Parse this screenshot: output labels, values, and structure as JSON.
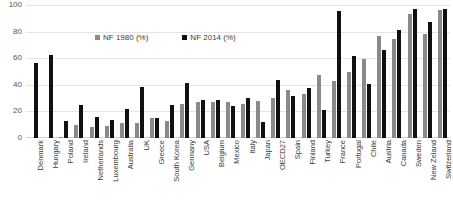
{
  "chart_data": {
    "type": "bar",
    "title": "",
    "xlabel": "",
    "ylabel": "",
    "ylim": [
      0,
      100
    ],
    "yticks": [
      0,
      20,
      40,
      60,
      80,
      100
    ],
    "grid": true,
    "legend_position": "top-center",
    "categories": [
      "Denmark",
      "Hungary",
      "Poland",
      "Ireland",
      "Netherlands",
      "Luxembourg",
      "Australia",
      "UK",
      "Greece",
      "South Korea",
      "Germany",
      "USA",
      "Belgium",
      "Mexico",
      "Italy",
      "Japan",
      "OECD27",
      "Spain",
      "Finland",
      "Turkey",
      "France",
      "Portugal",
      "Chile",
      "Austria",
      "Canada",
      "Sweden",
      "New Zeland",
      "Switzerland"
    ],
    "series": [
      {
        "name": "NF 1980 (%)",
        "color": "#8a8a8a",
        "values": [
          0,
          0,
          1,
          10,
          8,
          9,
          11,
          11,
          15,
          13,
          26,
          27,
          27,
          27,
          26,
          28,
          30,
          36,
          33,
          48,
          43,
          50,
          60,
          77,
          75,
          94,
          79,
          97
        ]
      },
      {
        "name": "NF 2014 (%)",
        "color": "#101010",
        "values": [
          57,
          63,
          13,
          25,
          16,
          14,
          22,
          39,
          15,
          25,
          42,
          29,
          29,
          24,
          30,
          12,
          44,
          32,
          38,
          21,
          96,
          62,
          41,
          67,
          82,
          98,
          88,
          98
        ]
      }
    ]
  },
  "axis": {
    "y_ticks": [
      "0",
      "20",
      "40",
      "60",
      "80",
      "100"
    ]
  },
  "legend": {
    "items": [
      {
        "label": "NF 1980 (%)",
        "color": "#8a8a8a"
      },
      {
        "label": "NF 2014 (%)",
        "color": "#101010"
      }
    ]
  }
}
